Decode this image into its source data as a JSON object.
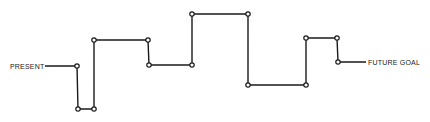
{
  "diagram": {
    "start_label": "PRESENT",
    "end_label": "FUTURE GOAL",
    "colors": {
      "line": "#1a1a1a",
      "node_fill": "#ffffff",
      "background": "#ffffff"
    },
    "path_points": [
      [
        45,
        66
      ],
      [
        77,
        66
      ],
      [
        78,
        109
      ],
      [
        94,
        109
      ],
      [
        94,
        40
      ],
      [
        148,
        40
      ],
      [
        149,
        65
      ],
      [
        192,
        65
      ],
      [
        192,
        14
      ],
      [
        248,
        14
      ],
      [
        248,
        85
      ],
      [
        306,
        85
      ],
      [
        306,
        38
      ],
      [
        337,
        38
      ],
      [
        338,
        62
      ],
      [
        366,
        62
      ]
    ],
    "nodes": [
      [
        77,
        66
      ],
      [
        78,
        109
      ],
      [
        94,
        109
      ],
      [
        94,
        40
      ],
      [
        148,
        40
      ],
      [
        149,
        65
      ],
      [
        192,
        65
      ],
      [
        192,
        14
      ],
      [
        248,
        14
      ],
      [
        248,
        85
      ],
      [
        306,
        85
      ],
      [
        306,
        38
      ],
      [
        337,
        38
      ],
      [
        338,
        62
      ]
    ]
  }
}
